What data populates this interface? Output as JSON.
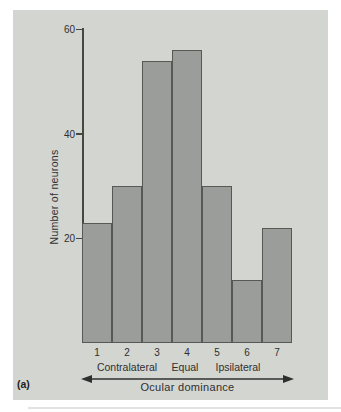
{
  "figure": {
    "panel_label": "(a)"
  },
  "chart_data": {
    "type": "bar",
    "title": "",
    "categories": [
      "1",
      "2",
      "3",
      "4",
      "5",
      "6",
      "7"
    ],
    "values": [
      23,
      30,
      54,
      56,
      30,
      12,
      22
    ],
    "ylabel": "Number of neurons",
    "xlabel": "Ocular dominance",
    "yticks": [
      20,
      40,
      60
    ],
    "ylim": [
      0,
      60
    ],
    "grid": "off",
    "legend": null,
    "axis_arrow": "double-headed horizontal arrow spanning x-axis",
    "group_labels": [
      {
        "label": "Contralateral",
        "under_categories": "1-3"
      },
      {
        "label": "Equal",
        "under_categories": "4"
      },
      {
        "label": "Ipsilateral",
        "under_categories": "5-7"
      }
    ],
    "colors": {
      "panel_bg": "#d3d5d1",
      "bar_fill": "#9b9d9a",
      "bar_border": "#565a55",
      "axis": "#44483f",
      "text": "#2f2f2f"
    }
  }
}
